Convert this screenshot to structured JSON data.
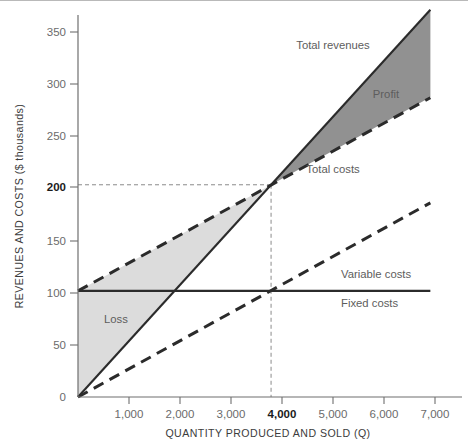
{
  "chart_data": {
    "type": "line",
    "title": "",
    "xlabel": "QUANTITY PRODUCED AND SOLD (Q)",
    "ylabel": "REVENUES AND COSTS ($ thousands)",
    "xlim": [
      0,
      7500
    ],
    "ylim": [
      0,
      360
    ],
    "grid": false,
    "legend_position": "inline-annotations",
    "x_ticks": [
      1000,
      2000,
      3000,
      4000,
      5000,
      6000,
      7000
    ],
    "x_tick_labels": [
      "1,000",
      "2,000",
      "3,000",
      "4,000",
      "5,000",
      "6,000",
      "7,000"
    ],
    "x_tick_bold": [
      "4,000"
    ],
    "y_ticks": [
      0,
      50,
      100,
      150,
      200,
      250,
      300,
      350
    ],
    "y_tick_labels": [
      "0",
      "50",
      "100",
      "150",
      "200",
      "250",
      "300",
      "350"
    ],
    "y_tick_bold": [
      "200"
    ],
    "series": [
      {
        "name": "Total revenues",
        "style": "solid",
        "label": "Total revenues",
        "label_x": 5000,
        "label_y": 332,
        "points": [
          [
            0,
            0
          ],
          [
            7300,
            365
          ]
        ],
        "slope_per_unit": 0.05,
        "intercept": 0
      },
      {
        "name": "Total costs",
        "style": "dashed",
        "label": "Total costs",
        "label_x": 5000,
        "label_y": 212,
        "points": [
          [
            0,
            100
          ],
          [
            7300,
            282
          ]
        ],
        "slope_per_unit": 0.025,
        "intercept": 100
      },
      {
        "name": "Variable costs",
        "style": "dashed",
        "label": "Variable costs",
        "label_x": 5150,
        "label_y": 118,
        "points": [
          [
            0,
            0
          ],
          [
            7300,
            183
          ]
        ],
        "slope_per_unit": 0.025,
        "intercept": 0
      },
      {
        "name": "Fixed costs",
        "style": "solid",
        "label": "Fixed costs",
        "label_x": 5150,
        "label_y": 89,
        "points": [
          [
            0,
            100
          ],
          [
            7300,
            100
          ]
        ],
        "slope_per_unit": 0,
        "intercept": 100
      }
    ],
    "regions": [
      {
        "name": "Loss",
        "label": "Loss",
        "label_x": 650,
        "label_y": 72,
        "fill": "#dcdcdc",
        "bounded_by": [
          "Total costs",
          "Total revenues"
        ],
        "x_range": [
          0,
          4000
        ]
      },
      {
        "name": "Profit",
        "label": "Profit",
        "label_x": 5450,
        "label_y": 288,
        "fill": "#919191",
        "bounded_by": [
          "Total revenues",
          "Total costs"
        ],
        "x_range": [
          4000,
          7300
        ]
      }
    ],
    "annotations": [
      {
        "name": "break-even-point",
        "x": 4000,
        "y": 200,
        "guide_to_x_axis": true,
        "guide_to_y_axis": true
      }
    ],
    "colors": {
      "line": "#2b2b2b",
      "axis": "#6f6f6f",
      "text": "#5d5d5d",
      "profit_fill": "#919191",
      "loss_fill": "#dcdcdc",
      "guide": "#8a8a8a"
    }
  }
}
